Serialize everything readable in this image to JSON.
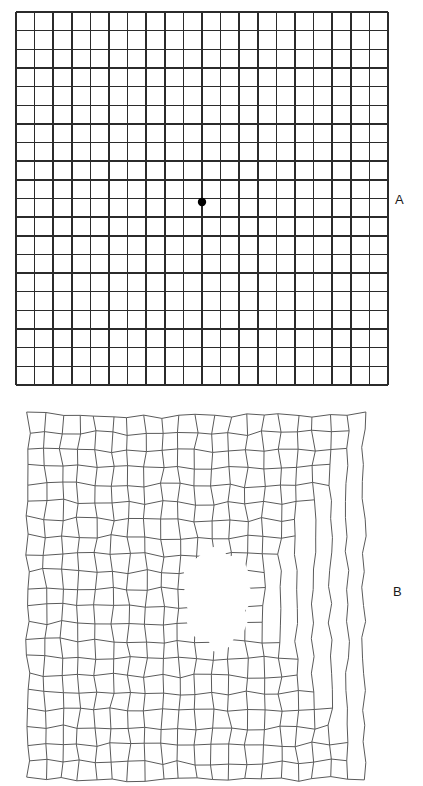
{
  "figure": {
    "kind": "amsler-grid-figure",
    "background_color": "#ffffff",
    "width": 423,
    "height": 786
  },
  "panels": [
    {
      "id": "panel-a",
      "label": "A",
      "label_position": {
        "x": 395,
        "y": 192
      },
      "caption": "Normal Amsler grid with central fixation dot",
      "grid": {
        "type": "regular",
        "x": 16,
        "y": 12,
        "width": 372,
        "height": 373,
        "columns": 20,
        "rows": 20,
        "line_color": "#2b2b2b",
        "line_width": 1.45,
        "border_width": 1.8
      },
      "fixation_dot": {
        "name": "central-fixation-dot",
        "x": 202,
        "y": 202,
        "radius": 4.2,
        "color": "#000000"
      }
    },
    {
      "id": "panel-b",
      "label": "B",
      "label_position": {
        "x": 393,
        "y": 584
      },
      "caption": "Distorted Amsler grid showing metamorphopsia and a central scotoma",
      "grid": {
        "type": "distorted",
        "x": 28,
        "y": 414,
        "width": 336,
        "height": 364,
        "columns": 20,
        "rows": 21,
        "line_color": "#5a5a5a",
        "line_width": 1.0,
        "warp_amplitude": 3.0
      },
      "scotoma": {
        "name": "central-scotoma-blob",
        "color": "#ffffff",
        "polygon": [
          [
            206,
            552
          ],
          [
            214,
            548
          ],
          [
            222,
            551
          ],
          [
            228,
            558
          ],
          [
            237,
            556
          ],
          [
            243,
            562
          ],
          [
            247,
            572
          ],
          [
            246,
            584
          ],
          [
            251,
            592
          ],
          [
            250,
            602
          ],
          [
            244,
            610
          ],
          [
            247,
            620
          ],
          [
            243,
            630
          ],
          [
            234,
            636
          ],
          [
            228,
            646
          ],
          [
            221,
            652
          ],
          [
            214,
            650
          ],
          [
            210,
            641
          ],
          [
            204,
            633
          ],
          [
            196,
            636
          ],
          [
            190,
            631
          ],
          [
            188,
            621
          ],
          [
            192,
            612
          ],
          [
            186,
            604
          ],
          [
            184,
            594
          ],
          [
            188,
            584
          ],
          [
            185,
            573
          ],
          [
            191,
            563
          ],
          [
            199,
            558
          ]
        ]
      },
      "ragged_edges": {
        "top_right_staircase": true,
        "bottom_right_staircase": true,
        "description": "Grid lines terminate early along an irregular right-hand boundary producing a stepped outline"
      }
    }
  ]
}
